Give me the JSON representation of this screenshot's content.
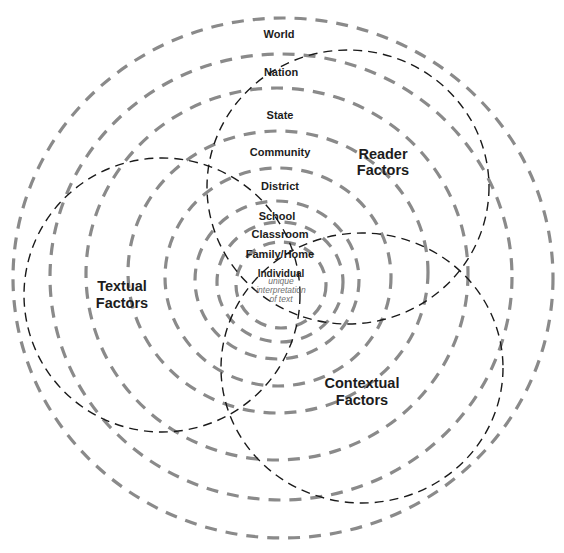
{
  "diagram": {
    "type": "concentric-rings-with-overlapping-factor-circles",
    "colors": {
      "ring_stroke": "#8a8a8a",
      "factor_stroke": "#1a1a1a",
      "label_text": "#1c1c1c",
      "note_text": "#6f6f6f",
      "background": "#ffffff"
    },
    "rings": [
      {
        "label": "World"
      },
      {
        "label": "Nation"
      },
      {
        "label": "State"
      },
      {
        "label": "Community"
      },
      {
        "label": "District"
      },
      {
        "label": "School"
      },
      {
        "label": "Classroom"
      },
      {
        "label": "Family/Home"
      },
      {
        "label": "Individual"
      }
    ],
    "center_note": {
      "line1": "unique",
      "line2": "interpretation",
      "line3": "of text"
    },
    "factors": [
      {
        "name": "reader",
        "line1": "Reader",
        "line2": "Factors"
      },
      {
        "name": "textual",
        "line1": "Textual",
        "line2": "Factors"
      },
      {
        "name": "contextual",
        "line1": "Contextual",
        "line2": "Factors"
      }
    ]
  }
}
